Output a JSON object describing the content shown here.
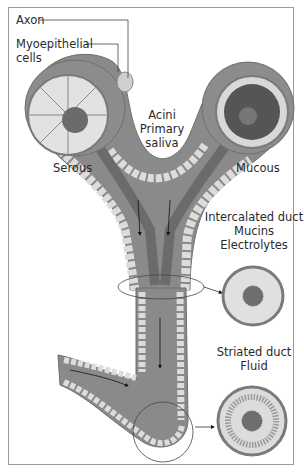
{
  "figure": {
    "labels": {
      "axon": "Axon",
      "myoepithelial_line1": "Myoepithelial",
      "myoepithelial_line2": "cells",
      "acini_line1": "Acini",
      "acini_line2": "Primary",
      "acini_line3": "saliva",
      "serous": "Serous",
      "mucous": "Mucous",
      "intercalated_line1": "Intercalated duct",
      "intercalated_line2": "Mucins",
      "intercalated_line3": "Electrolytes",
      "striated_line1": "Striated duct",
      "striated_line2": "Fluid"
    },
    "colors": {
      "duct_outer": "#8a8a8a",
      "duct_lumen": "#7d7d7d",
      "cells": "#d9d9d9",
      "frame": "#9a9a9a",
      "granules": "#3a3a3a"
    }
  }
}
